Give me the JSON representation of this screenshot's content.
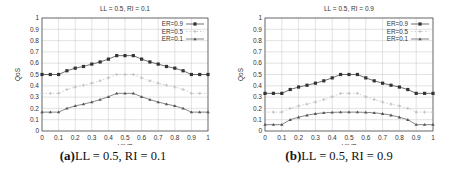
{
  "chart_data": [
    {
      "type": "line",
      "title": "LL = 0.5, RI = 0.1",
      "xlabel": "UIVP",
      "ylabel": "QoS",
      "xlim": [
        0,
        1
      ],
      "ylim": [
        0,
        1
      ],
      "grid": true,
      "legend_position": "top-right",
      "xticks": [
        "0",
        "0.1",
        "0.2",
        "0.3",
        "0.4",
        "0.5",
        "0.6",
        "0.7",
        "0.8",
        "0.9",
        "1"
      ],
      "yticks": [
        "0",
        "0.1",
        "0.2",
        "0.3",
        "0.4",
        "0.5",
        "0.6",
        "0.7",
        "0.8",
        "0.9",
        "1"
      ],
      "x": [
        0,
        0.05,
        0.1,
        0.15,
        0.2,
        0.25,
        0.3,
        0.35,
        0.4,
        0.45,
        0.5,
        0.55,
        0.6,
        0.65,
        0.7,
        0.75,
        0.8,
        0.85,
        0.9,
        0.95,
        1
      ],
      "series": [
        {
          "name": "ER=0.9",
          "color": "#333333",
          "marker": "filled-square",
          "values": [
            0.5,
            0.5,
            0.5,
            0.533,
            0.556,
            0.571,
            0.592,
            0.611,
            0.636,
            0.667,
            0.667,
            0.667,
            0.636,
            0.611,
            0.592,
            0.571,
            0.556,
            0.533,
            0.5,
            0.5,
            0.5
          ]
        },
        {
          "name": "ER=0.5",
          "color": "#bbbbbb",
          "marker": "plus",
          "values": [
            0.333,
            0.333,
            0.333,
            0.367,
            0.389,
            0.405,
            0.423,
            0.444,
            0.47,
            0.5,
            0.5,
            0.5,
            0.47,
            0.444,
            0.423,
            0.405,
            0.389,
            0.367,
            0.333,
            0.333,
            0.333
          ]
        },
        {
          "name": "ER=0.1",
          "color": "#555555",
          "marker": "triangle",
          "values": [
            0.167,
            0.167,
            0.167,
            0.2,
            0.222,
            0.238,
            0.256,
            0.278,
            0.303,
            0.333,
            0.333,
            0.333,
            0.303,
            0.278,
            0.256,
            0.238,
            0.222,
            0.2,
            0.167,
            0.167,
            0.167
          ]
        }
      ]
    },
    {
      "type": "line",
      "title": "LL = 0.5, RI = 0.9",
      "xlabel": "UIVP",
      "ylabel": "QoS",
      "xlim": [
        0,
        1
      ],
      "ylim": [
        0,
        1
      ],
      "grid": true,
      "legend_position": "top-right",
      "xticks": [
        "0",
        "0.1",
        "0.2",
        "0.3",
        "0.4",
        "0.5",
        "0.6",
        "0.7",
        "0.8",
        "0.9",
        "1"
      ],
      "yticks": [
        "0",
        "0.1",
        "0.2",
        "0.3",
        "0.4",
        "0.5",
        "0.6",
        "0.7",
        "0.8",
        "0.9",
        "1"
      ],
      "x": [
        0,
        0.05,
        0.1,
        0.15,
        0.2,
        0.25,
        0.3,
        0.35,
        0.4,
        0.45,
        0.5,
        0.55,
        0.6,
        0.65,
        0.7,
        0.75,
        0.8,
        0.85,
        0.9,
        0.95,
        1
      ],
      "series": [
        {
          "name": "ER=0.9",
          "color": "#333333",
          "marker": "filled-square",
          "values": [
            0.333,
            0.333,
            0.333,
            0.367,
            0.389,
            0.405,
            0.423,
            0.444,
            0.47,
            0.5,
            0.5,
            0.5,
            0.47,
            0.444,
            0.423,
            0.405,
            0.389,
            0.367,
            0.333,
            0.333,
            0.333
          ]
        },
        {
          "name": "ER=0.5",
          "color": "#bbbbbb",
          "marker": "plus",
          "values": [
            0.167,
            0.167,
            0.167,
            0.2,
            0.222,
            0.238,
            0.256,
            0.278,
            0.303,
            0.333,
            0.333,
            0.333,
            0.303,
            0.278,
            0.256,
            0.238,
            0.222,
            0.2,
            0.167,
            0.167,
            0.167
          ]
        },
        {
          "name": "ER=0.1",
          "color": "#555555",
          "marker": "triangle",
          "values": [
            0.056,
            0.056,
            0.056,
            0.1,
            0.122,
            0.14,
            0.153,
            0.161,
            0.165,
            0.167,
            0.167,
            0.167,
            0.165,
            0.161,
            0.153,
            0.14,
            0.122,
            0.1,
            0.056,
            0.056,
            0.056
          ]
        }
      ]
    }
  ],
  "captions": [
    {
      "label": "(a)",
      "text": "LL = 0.5, RI = 0.1"
    },
    {
      "label": "(b)",
      "text": "LL = 0.5, RI = 0.9"
    }
  ]
}
